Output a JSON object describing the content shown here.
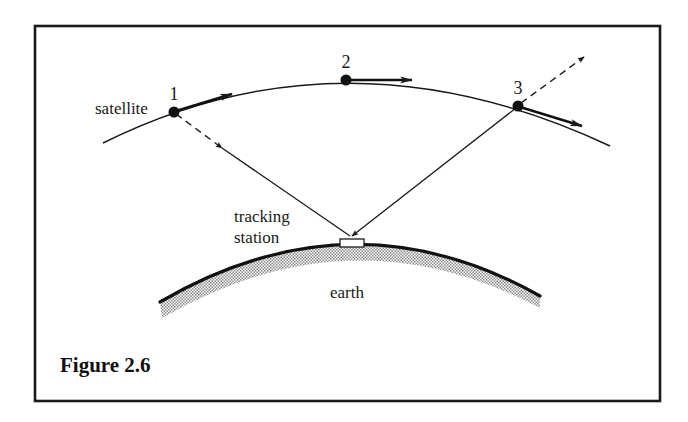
{
  "figure": {
    "caption": "Figure 2.6",
    "frame": {
      "x": 34,
      "y": 25,
      "width": 627,
      "height": 377,
      "stroke": "#1a1a1a"
    }
  },
  "labels": {
    "satellite": "satellite",
    "tracking": "tracking",
    "station": "station",
    "earth": "earth"
  },
  "positions": [
    {
      "id": "1",
      "label": "1",
      "x": 174,
      "y": 112
    },
    {
      "id": "2",
      "label": "2",
      "x": 346,
      "y": 80
    },
    {
      "id": "3",
      "label": "3",
      "x": 518,
      "y": 106
    }
  ],
  "colors": {
    "ink": "#1a1a1a",
    "earth_stipple": "#9a9a9a",
    "background": "#ffffff"
  }
}
